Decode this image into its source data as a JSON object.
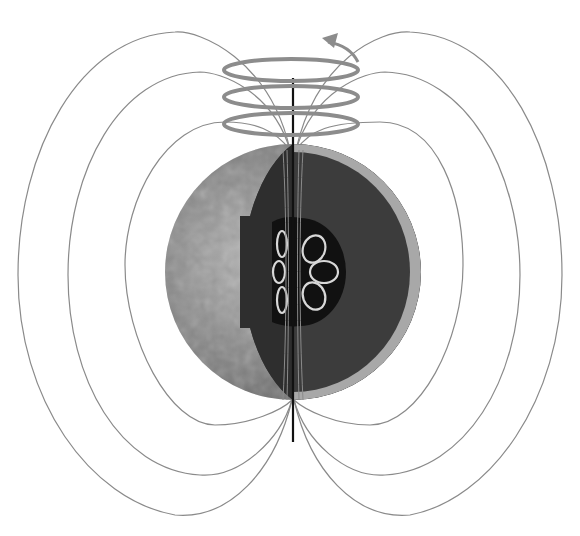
{
  "diagram": {
    "subject": "Planetary magnetic dynamo",
    "colors": {
      "background": "#ffffff",
      "field_line": "#8a8a8a",
      "rotation_band": "#8c8c8c",
      "axis": "#111111",
      "surface": "#7a7a7a",
      "mantle": "#3a3a3a",
      "mantle_rim": "#a8a8a8",
      "core": "#111111",
      "convection_loop": "#d8d8d8"
    },
    "elements": {
      "field_lines_count": 6,
      "rotation_bands_count": 3,
      "convection_loops_count": 6,
      "rotation_arrow": "counterclockwise"
    }
  }
}
